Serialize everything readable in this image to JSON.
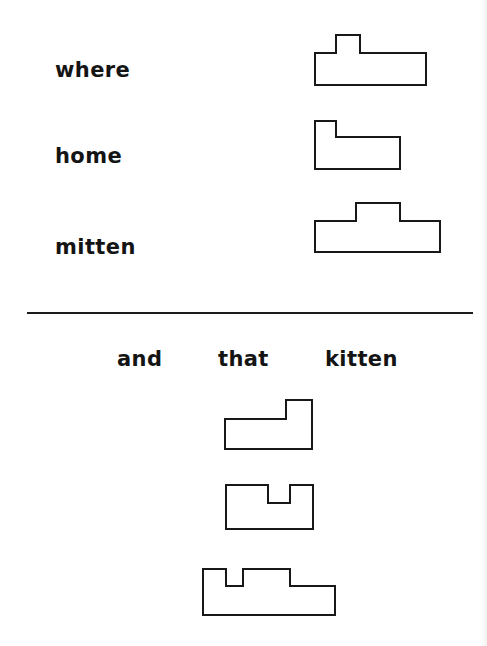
{
  "worksheet": {
    "top_section": {
      "items": [
        {
          "word": "where",
          "shape_name": "where-word-shape"
        },
        {
          "word": "home",
          "shape_name": "home-word-shape"
        },
        {
          "word": "mitten",
          "shape_name": "mitten-word-shape"
        }
      ]
    },
    "bottom_section": {
      "word_choices": [
        "and",
        "that",
        "kitten"
      ],
      "shapes_count": 3
    }
  },
  "colors": {
    "ink": "#141414",
    "background": "#ffffff"
  }
}
